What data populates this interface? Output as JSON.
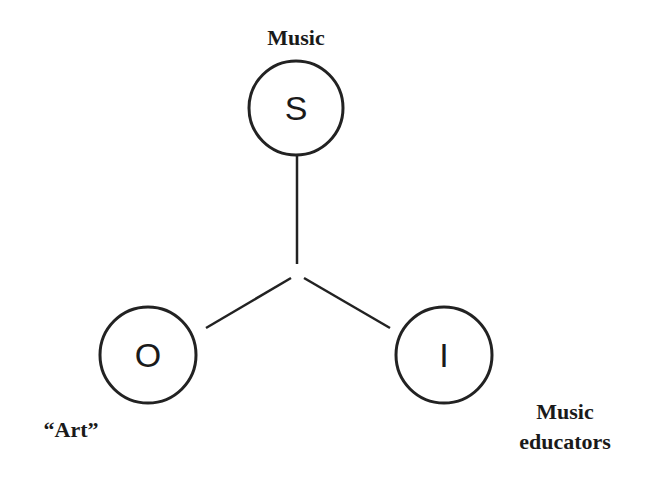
{
  "diagram": {
    "type": "three-node star (S-O-I triangle)",
    "nodes": [
      {
        "id": "S",
        "letter": "S",
        "label": "Music",
        "cx": 296,
        "cy": 108,
        "r": 48
      },
      {
        "id": "O",
        "letter": "O",
        "label": "“Art”",
        "cx": 148,
        "cy": 355,
        "r": 48
      },
      {
        "id": "I",
        "letter": "I",
        "label_line1": "Music",
        "label_line2": "educators",
        "cx": 444,
        "cy": 355,
        "r": 48
      }
    ],
    "edges": [
      {
        "from": "S",
        "to": "center"
      },
      {
        "from": "O",
        "to": "center"
      },
      {
        "from": "I",
        "to": "center"
      }
    ],
    "line_color": "#222222"
  }
}
